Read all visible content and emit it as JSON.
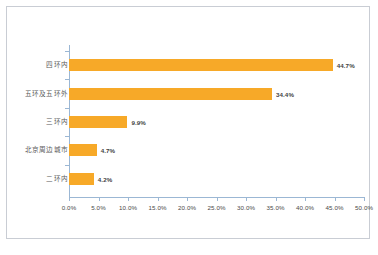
{
  "chart_data": {
    "type": "bar",
    "orientation": "horizontal",
    "title": "",
    "xlabel": "",
    "ylabel": "",
    "categories": [
      "四环内",
      "五环及五环外",
      "三环内",
      "北京周边城市",
      "二环内"
    ],
    "values": [
      44.7,
      34.4,
      9.9,
      4.7,
      4.2
    ],
    "value_labels": [
      "44.7%",
      "34.4%",
      "9.9%",
      "4.7%",
      "4.2%"
    ],
    "xlim": [
      0,
      50
    ],
    "xticks": [
      0,
      5,
      10,
      15,
      20,
      25,
      30,
      35,
      40,
      45,
      50
    ],
    "xtick_labels": [
      "0.0%",
      "5.0%",
      "10.0%",
      "15.0%",
      "20.0%",
      "25.0%",
      "30.0%",
      "35.0%",
      "40.0%",
      "45.0%",
      "50.0%"
    ],
    "grid": false,
    "legend": null,
    "series_color": "#f7a928",
    "axis_color": "#9bb7d4"
  },
  "frame": {
    "border_color": "#c9cdd4"
  }
}
